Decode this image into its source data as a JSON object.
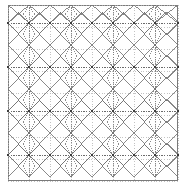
{
  "figure": {
    "type": "geometric-lattice",
    "width": 186,
    "height": 187,
    "background_color": "#ffffff",
    "frame": {
      "x": 8,
      "y": 5,
      "width": 170,
      "height": 176,
      "stroke_color": "#7a7a7a",
      "stroke_width": 1,
      "fill": "#ffffff"
    },
    "colors": {
      "frame": "#7a7a7a",
      "grid": "#b4b4b4",
      "axis": "#5a5a5a",
      "spindle": "#6e6e6e",
      "bond": "#747474",
      "diamond": "#6a6a6a",
      "node": "#3c3c3c"
    },
    "grid": {
      "vertical_x": [
        8,
        29,
        50,
        71,
        92,
        113,
        134,
        155,
        178
      ],
      "horizontal_y": [
        5,
        27,
        49,
        71,
        93,
        115,
        137,
        159,
        181
      ],
      "style": "dotted",
      "visible": true
    },
    "lattice": {
      "node_rows_y": [
        23,
        67,
        111,
        155
      ],
      "node_cols_x": [
        8,
        29,
        50,
        71,
        92,
        113,
        134,
        155,
        178
      ],
      "axis_rows_y": [
        23,
        67,
        111,
        155
      ],
      "spindle_cols_x": [
        29,
        71,
        113,
        155
      ],
      "spindle_half_height": 22,
      "diamond_half_width": 21,
      "diamond_half_height": 11,
      "node_radius": 1.1,
      "period_x": 42,
      "period_y": 44
    }
  }
}
